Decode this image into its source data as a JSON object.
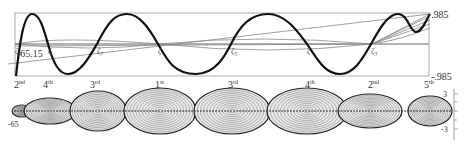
{
  "top_plot": {
    "right_axis": {
      "top_label": ".985",
      "bottom_label": "-.985"
    },
    "left_label": "-65.15",
    "crossing_labels": [
      {
        "text": "ζ",
        "sub": "9",
        "x": 15
      },
      {
        "text": "ζ",
        "sub": "",
        "x": 48
      },
      {
        "text": "ζ",
        "sub": "7",
        "x": 97
      },
      {
        "text": "ζ",
        "sub": "",
        "x": 158
      },
      {
        "text": "ζ",
        "sub": "5",
        "x": 231
      },
      {
        "text": "ζ",
        "sub": "",
        "x": 307
      },
      {
        "text": "ζ",
        "sub": "3",
        "x": 371
      }
    ],
    "ordinal_labels": [
      {
        "num": "2",
        "suf": "nd",
        "x": 14
      },
      {
        "num": "4",
        "suf": "th",
        "x": 43
      },
      {
        "num": "3",
        "suf": "rd",
        "x": 90
      },
      {
        "num": "1",
        "suf": "st",
        "x": 155
      },
      {
        "num": "3",
        "suf": "rd",
        "x": 228
      },
      {
        "num": "4",
        "suf": "th",
        "x": 305
      },
      {
        "num": "2",
        "suf": "nd",
        "x": 368
      },
      {
        "num": "5",
        "suf": "th",
        "x": 424
      }
    ],
    "colors": {
      "main_curve": "#111111",
      "thin_lines": "#888888",
      "frame": "#999999"
    }
  },
  "bottom_plot": {
    "left_label": "-65",
    "right_axis": {
      "top_label": "3",
      "bottom_label": "-3"
    },
    "lobes": [
      {
        "cx": 22,
        "rx": 10,
        "ry": 6
      },
      {
        "cx": 50,
        "rx": 26,
        "ry": 13
      },
      {
        "cx": 98,
        "rx": 28,
        "ry": 20
      },
      {
        "cx": 160,
        "rx": 36,
        "ry": 23
      },
      {
        "cx": 232,
        "rx": 38,
        "ry": 23
      },
      {
        "cx": 307,
        "rx": 40,
        "ry": 23
      },
      {
        "cx": 370,
        "rx": 32,
        "ry": 17
      },
      {
        "cx": 430,
        "rx": 22,
        "ry": 15
      }
    ]
  }
}
